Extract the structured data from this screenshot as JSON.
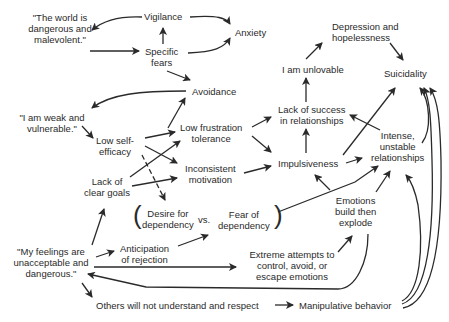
{
  "diagram": {
    "type": "cognitive-behavioral causal map",
    "nodes": {
      "world_dangerous": "\"The world is\ndangerous and\nmalevolent.\"",
      "vigilance": "Vigilance",
      "anxiety": "Anxiety",
      "specific_fears": "Specific\nfears",
      "avoidance": "Avoidance",
      "weak_vulnerable": "\"I am weak and\nvulnerable.\"",
      "low_self_efficacy": "Low self-\nefficacy",
      "low_frustration_tolerance": "Low frustration\ntolerance",
      "lack_clear_goals": "Lack of\nclear goals",
      "inconsistent_motivation": "Inconsistent\nmotivation",
      "desire_dependency": "Desire for\ndependency",
      "vs": "vs.",
      "fear_dependency": "Fear of\ndependency",
      "feelings_unacceptable": "\"My feelings are\nunacceptable and\ndangerous.\"",
      "anticipation_rejection": "Anticipation\nof rejection",
      "extreme_attempts": "Extreme attempts to\ncontrol, avoid, or\nescape emotions",
      "others_not_understand": "Others will not understand and respect",
      "manipulative_behavior": "Manipulative behavior",
      "depression_hopelessness": "Depression and\nhopelessness",
      "i_am_unlovable": "I am unlovable",
      "suicidality": "Suicidality",
      "lack_success_relationships": "Lack of success\nin relationships",
      "impulsiveness": "Impulsiveness",
      "intense_unstable": "Intense,\nunstable\nrelationships",
      "emotions_build": "Emotions\nbuild then\nexplode"
    },
    "edges": [
      [
        "vigilance",
        "world_dangerous"
      ],
      [
        "vigilance",
        "anxiety"
      ],
      [
        "world_dangerous",
        "specific_fears"
      ],
      [
        "specific_fears",
        "vigilance"
      ],
      [
        "specific_fears",
        "anxiety"
      ],
      [
        "specific_fears",
        "avoidance"
      ],
      [
        "avoidance",
        "weak_vulnerable"
      ],
      [
        "weak_vulnerable",
        "low_self_efficacy"
      ],
      [
        "low_self_efficacy",
        "avoidance"
      ],
      [
        "low_self_efficacy",
        "low_frustration_tolerance"
      ],
      [
        "low_self_efficacy",
        "inconsistent_motivation"
      ],
      [
        "low_self_efficacy",
        "desire_dependency"
      ],
      [
        "lack_clear_goals",
        "low_frustration_tolerance"
      ],
      [
        "lack_clear_goals",
        "inconsistent_motivation"
      ],
      [
        "low_frustration_tolerance",
        "lack_success_relationships"
      ],
      [
        "low_frustration_tolerance",
        "impulsiveness"
      ],
      [
        "inconsistent_motivation",
        "impulsiveness"
      ],
      [
        "impulsiveness",
        "lack_success_relationships"
      ],
      [
        "impulsiveness",
        "intense_unstable"
      ],
      [
        "impulsiveness",
        "suicidality"
      ],
      [
        "lack_success_relationships",
        "i_am_unlovable"
      ],
      [
        "i_am_unlovable",
        "depression_hopelessness"
      ],
      [
        "depression_hopelessness",
        "suicidality"
      ],
      [
        "intense_unstable",
        "lack_success_relationships"
      ],
      [
        "intense_unstable",
        "suicidality"
      ],
      [
        "emotions_build",
        "impulsiveness"
      ],
      [
        "emotions_build",
        "intense_unstable"
      ],
      [
        "fear_dependency",
        "intense_unstable"
      ],
      [
        "feelings_unacceptable",
        "lack_clear_goals"
      ],
      [
        "feelings_unacceptable",
        "anticipation_rejection"
      ],
      [
        "anticipation_rejection",
        "fear_dependency"
      ],
      [
        "feelings_unacceptable",
        "extreme_attempts"
      ],
      [
        "extreme_attempts",
        "emotions_build"
      ],
      [
        "emotions_build",
        "feelings_unacceptable"
      ],
      [
        "feelings_unacceptable",
        "others_not_understand"
      ],
      [
        "others_not_understand",
        "manipulative_behavior"
      ],
      [
        "manipulative_behavior",
        "intense_unstable"
      ],
      [
        "manipulative_behavior",
        "suicidality"
      ]
    ]
  }
}
